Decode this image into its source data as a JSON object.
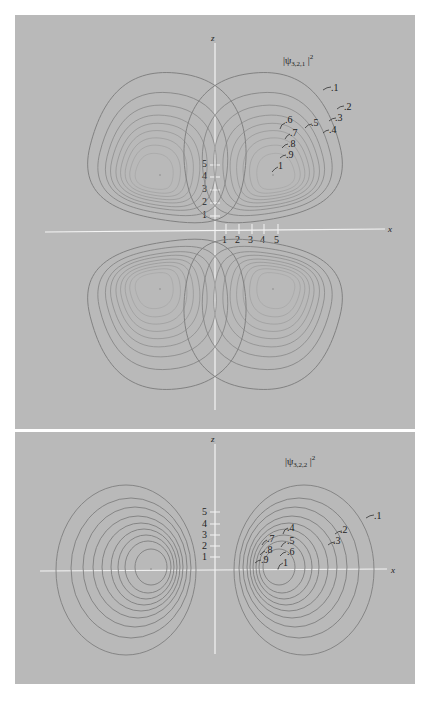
{
  "figure": {
    "panels": [
      {
        "id": "psi_321",
        "title_main": "|ψ",
        "title_sub": "3,2,1",
        "title_tail": "|",
        "title_sup": "2",
        "axis_x_label": "x",
        "axis_z_label": "z",
        "x_ticks": [
          "1",
          "2",
          "3",
          "4",
          "5"
        ],
        "z_ticks": [
          "1",
          "2",
          "3",
          "4",
          "5"
        ],
        "contour_levels": [
          ".1",
          ".2",
          ".3",
          ".4",
          ".5",
          ".6",
          ".7",
          ".8",
          ".9",
          "1"
        ],
        "lobes": 4
      },
      {
        "id": "psi_322",
        "title_main": "|ψ",
        "title_sub": "3,2,2",
        "title_tail": "|",
        "title_sup": "2",
        "axis_x_label": "x",
        "axis_z_label": "z",
        "z_ticks": [
          "1",
          "2",
          "3",
          "4",
          "5"
        ],
        "contour_levels": [
          ".1",
          ".2",
          ".3",
          ".4",
          ".5",
          ".6",
          ".7",
          ".8",
          ".9",
          "1"
        ],
        "lobes": 2
      }
    ],
    "colors": {
      "panel_background": "#b9b9b9",
      "contour_stroke": "#7f7f7f",
      "axis": "#f4f4f4",
      "text": "#222222"
    }
  }
}
